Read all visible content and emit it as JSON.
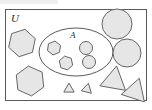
{
  "diagram": {
    "universe": {
      "label": "U",
      "shape": "rectangle",
      "x": 5.5,
      "y": 9.5,
      "width": 141,
      "height": 91,
      "label_x": 11,
      "label_y": 22
    },
    "subset": {
      "label": "A",
      "shape": "ellipse",
      "cx": 76,
      "cy": 52,
      "rx": 37,
      "ry": 24,
      "label_x": 70,
      "label_y": 38
    },
    "elements_inside_a": [
      {
        "name": "small-hexagon",
        "shape": "hexagon",
        "cx": 54,
        "cy": 48,
        "r": 7,
        "rotation": 8
      },
      {
        "name": "small-hexagon",
        "shape": "hexagon",
        "cx": 66,
        "cy": 63,
        "r": 7,
        "rotation": -12
      },
      {
        "name": "small-circle",
        "shape": "circle",
        "cx": 86,
        "cy": 48,
        "r": 6.5,
        "rotation": 0
      },
      {
        "name": "small-circle",
        "shape": "circle",
        "cx": 89,
        "cy": 62,
        "r": 6.5,
        "rotation": 0
      }
    ],
    "elements_outside_a": [
      {
        "name": "large-hexagon",
        "shape": "hexagon",
        "cx": 22,
        "cy": 43,
        "r": 14,
        "rotation": 12
      },
      {
        "name": "large-hexagon",
        "shape": "hexagon",
        "cx": 30,
        "cy": 81,
        "r": 15,
        "rotation": -6
      },
      {
        "name": "large-circle",
        "shape": "circle",
        "cx": 117,
        "cy": 24,
        "r": 15,
        "rotation": 0
      },
      {
        "name": "large-circle",
        "shape": "circle",
        "cx": 127,
        "cy": 53,
        "r": 14,
        "rotation": 0
      },
      {
        "name": "large-triangle",
        "shape": "triangle",
        "cx": 114,
        "cy": 78,
        "r": 15,
        "rotation": 10
      },
      {
        "name": "large-triangle",
        "shape": "triangle",
        "cx": 135,
        "cy": 89,
        "r": 14,
        "rotation": 18
      },
      {
        "name": "tiny-triangle",
        "shape": "triangle",
        "cx": 69,
        "cy": 88,
        "r": 6,
        "rotation": 0
      },
      {
        "name": "tiny-triangle",
        "shape": "triangle",
        "cx": 87,
        "cy": 88,
        "r": 6,
        "rotation": 14
      }
    ],
    "colors": {
      "shape_fill": "#e6e6e6",
      "shape_stroke": "#666666",
      "boundary_stroke": "#5a5a5a",
      "label_color": "#2a2a2a",
      "background": "#ffffff"
    },
    "counts": {
      "inside_a_total": "4",
      "outside_a_total": "8"
    }
  }
}
